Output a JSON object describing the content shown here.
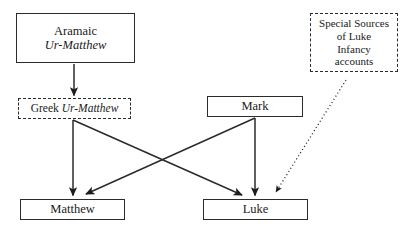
{
  "diagram": {
    "background_color": "#ffffff",
    "stroke_color": "#2b2b2b",
    "text_color": "#1a1a1a",
    "nodes": [
      {
        "id": "aramaic_ur_matthew",
        "border": "solid",
        "lines": [
          {
            "text": "Aramaic",
            "style": "roman"
          },
          {
            "text": "Ur-Matthew",
            "style": "italic"
          }
        ]
      },
      {
        "id": "greek_ur_matthew",
        "border": "dashed",
        "lines": [
          {
            "text": "Greek ",
            "style": "roman"
          },
          {
            "text": "Ur-Matthew",
            "style": "italic"
          }
        ]
      },
      {
        "id": "special_sources_luke_infancy",
        "border": "dashed",
        "lines": [
          {
            "text": "Special Sources",
            "style": "roman"
          },
          {
            "text": "of Luke",
            "style": "roman"
          },
          {
            "text": "Infancy",
            "style": "roman"
          },
          {
            "text": "accounts",
            "style": "roman"
          }
        ]
      },
      {
        "id": "mark",
        "border": "solid",
        "lines": [
          {
            "text": "Mark",
            "style": "roman"
          }
        ]
      },
      {
        "id": "matthew",
        "border": "solid",
        "lines": [
          {
            "text": "Matthew",
            "style": "roman"
          }
        ]
      },
      {
        "id": "luke",
        "border": "solid",
        "lines": [
          {
            "text": "Luke",
            "style": "roman"
          }
        ]
      }
    ],
    "edges": [
      {
        "id": "aramaic-to-greek",
        "from": "aramaic_ur_matthew",
        "to": "greek_ur_matthew",
        "style": "solid",
        "arrow": true
      },
      {
        "id": "greek-to-matthew",
        "from": "greek_ur_matthew",
        "to": "matthew",
        "style": "solid",
        "arrow": true
      },
      {
        "id": "greek-to-luke",
        "from": "greek_ur_matthew",
        "to": "luke",
        "style": "solid",
        "arrow": true
      },
      {
        "id": "mark-to-matthew",
        "from": "mark",
        "to": "matthew",
        "style": "solid",
        "arrow": true
      },
      {
        "id": "mark-to-luke",
        "from": "mark",
        "to": "luke",
        "style": "solid",
        "arrow": true
      },
      {
        "id": "special-to-luke",
        "from": "special_sources_luke_infancy",
        "to": "luke",
        "style": "dotted",
        "arrow": true
      }
    ]
  }
}
